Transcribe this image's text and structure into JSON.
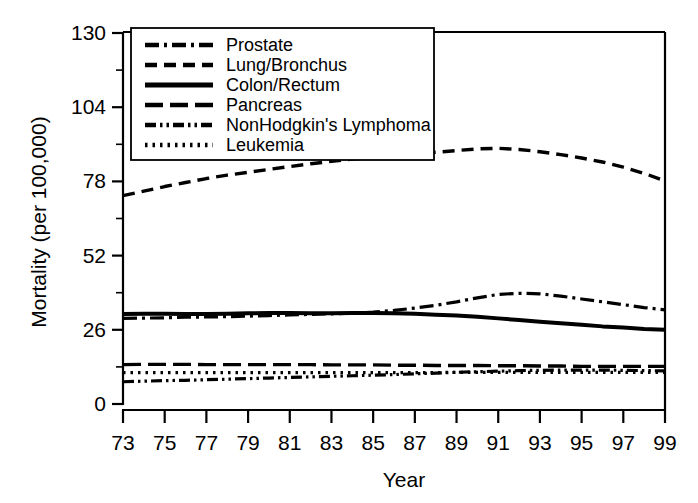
{
  "chart_data": {
    "type": "line",
    "title": "",
    "xlabel": "Year",
    "ylabel": "Mortality (per 100,000)",
    "xlim": [
      1973,
      1999
    ],
    "ylim": [
      0,
      130
    ],
    "grid": false,
    "legend_position": "top-left-inside",
    "x_tick_labels": [
      "73",
      "75",
      "77",
      "79",
      "81",
      "83",
      "85",
      "87",
      "89",
      "91",
      "93",
      "95",
      "97",
      "99"
    ],
    "x_tick_values": [
      1973,
      1975,
      1977,
      1979,
      1981,
      1983,
      1985,
      1987,
      1989,
      1991,
      1993,
      1995,
      1997,
      1999
    ],
    "x_minor_tick_values": [
      1974,
      1976,
      1978,
      1980,
      1982,
      1984,
      1986,
      1988,
      1990,
      1992,
      1994,
      1996,
      1998
    ],
    "y_tick_labels": [
      "0",
      "26",
      "52",
      "78",
      "104",
      "130"
    ],
    "y_tick_values": [
      0,
      26,
      52,
      78,
      104,
      130
    ],
    "y_minor_tick_values": [
      13,
      39,
      65,
      91,
      117
    ],
    "x": [
      1973,
      1974,
      1975,
      1976,
      1977,
      1978,
      1979,
      1980,
      1981,
      1982,
      1983,
      1984,
      1985,
      1986,
      1987,
      1988,
      1989,
      1990,
      1991,
      1992,
      1993,
      1994,
      1995,
      1996,
      1997,
      1998,
      1999
    ],
    "series": [
      {
        "name": "Prostate",
        "dash": "dash-dot",
        "values": [
          30.0,
          30.1,
          30.2,
          30.4,
          30.5,
          30.6,
          30.8,
          31.0,
          31.2,
          31.4,
          31.6,
          31.8,
          32.2,
          32.8,
          33.6,
          34.6,
          35.8,
          37.2,
          38.4,
          38.8,
          38.6,
          37.8,
          36.8,
          35.8,
          34.8,
          33.8,
          33.0
        ]
      },
      {
        "name": "Lung/Bronchus",
        "dash": "dashed",
        "values": [
          73.0,
          74.6,
          76.2,
          77.6,
          79.0,
          80.2,
          81.2,
          82.2,
          83.2,
          84.2,
          85.0,
          85.8,
          86.4,
          87.0,
          87.6,
          88.2,
          88.8,
          89.4,
          89.6,
          89.2,
          88.4,
          87.4,
          86.2,
          84.8,
          83.0,
          80.8,
          78.2
        ]
      },
      {
        "name": "Colon/Rectum",
        "dash": "solid",
        "values": [
          31.5,
          31.6,
          31.6,
          31.5,
          31.5,
          31.6,
          31.8,
          31.9,
          31.9,
          31.8,
          31.8,
          31.9,
          31.9,
          31.8,
          31.6,
          31.3,
          31.0,
          30.6,
          30.0,
          29.4,
          28.8,
          28.3,
          27.8,
          27.2,
          26.8,
          26.3,
          26.0
        ]
      },
      {
        "name": "Pancreas",
        "dash": "long-dash",
        "values": [
          13.8,
          13.9,
          13.9,
          13.9,
          13.8,
          13.8,
          13.8,
          13.8,
          13.8,
          13.8,
          13.7,
          13.7,
          13.7,
          13.6,
          13.6,
          13.5,
          13.5,
          13.5,
          13.4,
          13.4,
          13.3,
          13.3,
          13.2,
          13.2,
          13.2,
          13.2,
          13.2
        ]
      },
      {
        "name": "NonHodgkin's Lymphoma",
        "dash": "dash-dot-dot",
        "values": [
          7.8,
          8.0,
          8.2,
          8.3,
          8.5,
          8.7,
          8.9,
          9.1,
          9.3,
          9.5,
          9.7,
          9.9,
          10.1,
          10.3,
          10.6,
          10.8,
          11.1,
          11.3,
          11.5,
          11.7,
          11.8,
          11.9,
          11.9,
          11.9,
          11.8,
          11.7,
          11.6
        ]
      },
      {
        "name": "Leukemia",
        "dash": "dotted",
        "values": [
          11.0,
          11.0,
          11.0,
          11.0,
          11.0,
          11.0,
          11.0,
          11.0,
          11.0,
          11.0,
          11.0,
          11.0,
          11.0,
          11.0,
          11.0,
          11.0,
          11.1,
          11.1,
          11.1,
          11.1,
          11.1,
          11.1,
          11.1,
          11.1,
          11.1,
          11.1,
          11.1
        ]
      }
    ]
  },
  "legend": {
    "items": [
      {
        "label": "Prostate"
      },
      {
        "label": "Lung/Bronchus"
      },
      {
        "label": "Colon/Rectum"
      },
      {
        "label": "Pancreas"
      },
      {
        "label": "NonHodgkin's Lymphoma"
      },
      {
        "label": "Leukemia"
      }
    ]
  }
}
